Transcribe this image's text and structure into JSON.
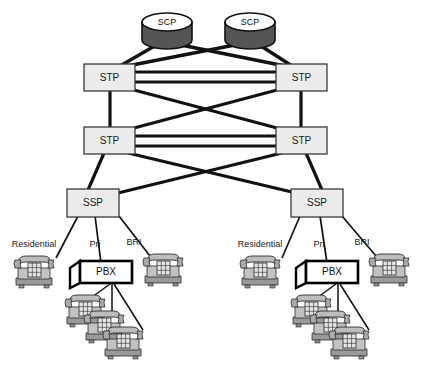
{
  "diagram": {
    "type": "network-diagram",
    "colors": {
      "line": "#111111",
      "thin_line": "#222222",
      "box_fill": "#ececec",
      "box_stroke": "#3a3a3a",
      "scp_body": "#555555",
      "scp_top": "#ffffff",
      "pbx_fill": "#ffffff",
      "pbx_stroke": "#000000",
      "phone_body": "#b8b8b8",
      "phone_shade": "#8f8f8f",
      "phone_light": "#d8d8d8",
      "background": "#ffffff"
    },
    "nodes": {
      "scp": [
        {
          "id": "scp-left",
          "label": "SCP",
          "x": 166,
          "y": 22
        },
        {
          "id": "scp-right",
          "label": "SCP",
          "x": 249,
          "y": 22
        }
      ],
      "stp": [
        {
          "id": "stp-upper-left",
          "label": "STP",
          "x": 108,
          "y": 78
        },
        {
          "id": "stp-upper-right",
          "label": "STP",
          "x": 300,
          "y": 78
        },
        {
          "id": "stp-lower-left",
          "label": "STP",
          "x": 108,
          "y": 140
        },
        {
          "id": "stp-lower-right",
          "label": "STP",
          "x": 300,
          "y": 140
        }
      ],
      "ssp": [
        {
          "id": "ssp-left",
          "label": "SSP",
          "x": 92,
          "y": 202
        },
        {
          "id": "ssp-right",
          "label": "SSP",
          "x": 315,
          "y": 202
        }
      ],
      "pbx": [
        {
          "id": "pbx-left",
          "label": "PBX",
          "x": 103,
          "y": 273
        },
        {
          "id": "pbx-right",
          "label": "PBX",
          "x": 329,
          "y": 273
        }
      ]
    },
    "link_labels": {
      "left": [
        {
          "id": "label-residential-left",
          "text": "Residential",
          "x": 33,
          "y": 244
        },
        {
          "id": "label-pri-left",
          "text": "Pri",
          "x": 94,
          "y": 244
        },
        {
          "id": "label-bri-left",
          "text": "BRI",
          "x": 134,
          "y": 241
        }
      ],
      "right": [
        {
          "id": "label-residential-right",
          "text": "Residential",
          "x": 259,
          "y": 244
        },
        {
          "id": "label-pri-right",
          "text": "Pri",
          "x": 318,
          "y": 244
        },
        {
          "id": "label-bri-right",
          "text": "BRI",
          "x": 362,
          "y": 241
        }
      ]
    },
    "phones": {
      "residential": [
        {
          "id": "phone-residential-left",
          "x": 14,
          "y": 256
        },
        {
          "id": "phone-residential-right",
          "x": 240,
          "y": 256
        }
      ],
      "bri": [
        {
          "id": "phone-bri-left",
          "x": 143,
          "y": 254
        },
        {
          "id": "phone-bri-right",
          "x": 369,
          "y": 254
        }
      ],
      "pbx_extensions": [
        {
          "id": "phone-ext-left-1",
          "x": 68,
          "y": 296
        },
        {
          "id": "phone-ext-left-2",
          "x": 87,
          "y": 312
        },
        {
          "id": "phone-ext-left-3",
          "x": 106,
          "y": 327
        },
        {
          "id": "phone-ext-right-1",
          "x": 294,
          "y": 296
        },
        {
          "id": "phone-ext-right-2",
          "x": 313,
          "y": 312
        },
        {
          "id": "phone-ext-right-3",
          "x": 332,
          "y": 327
        }
      ]
    },
    "edges": {
      "scp_to_stp": [
        {
          "from": "scp-left",
          "to": "stp-upper-left"
        },
        {
          "from": "scp-left",
          "to": "stp-upper-right"
        },
        {
          "from": "scp-right",
          "to": "stp-upper-left"
        },
        {
          "from": "scp-right",
          "to": "stp-upper-right"
        }
      ],
      "stp_mesh": [
        {
          "from": "stp-upper-left",
          "to": "stp-upper-right",
          "style": "double-horizontal"
        },
        {
          "from": "stp-lower-left",
          "to": "stp-lower-right",
          "style": "double-horizontal"
        },
        {
          "from": "stp-upper-left",
          "to": "stp-lower-left",
          "style": "vertical"
        },
        {
          "from": "stp-upper-right",
          "to": "stp-lower-right",
          "style": "vertical"
        },
        {
          "from": "stp-upper-left",
          "to": "stp-lower-right",
          "style": "diagonal"
        },
        {
          "from": "stp-upper-right",
          "to": "stp-lower-left",
          "style": "diagonal"
        }
      ],
      "stp_to_ssp": [
        {
          "from": "stp-lower-left",
          "to": "ssp-left"
        },
        {
          "from": "stp-lower-left",
          "to": "ssp-right"
        },
        {
          "from": "stp-lower-right",
          "to": "ssp-left"
        },
        {
          "from": "stp-lower-right",
          "to": "ssp-right"
        }
      ],
      "ssp_to_endpoints": [
        {
          "from": "ssp-left",
          "to": "phone-residential-left",
          "label": "Residential"
        },
        {
          "from": "ssp-left",
          "to": "pbx-left",
          "label": "Pri"
        },
        {
          "from": "ssp-left",
          "to": "phone-bri-left",
          "label": "BRI"
        },
        {
          "from": "ssp-right",
          "to": "phone-residential-right",
          "label": "Residential"
        },
        {
          "from": "ssp-right",
          "to": "pbx-right",
          "label": "Pri"
        },
        {
          "from": "ssp-right",
          "to": "phone-bri-right",
          "label": "BRI"
        }
      ]
    }
  }
}
